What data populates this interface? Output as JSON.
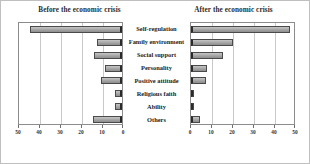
{
  "figure": {
    "left_title": "Before the economic crisis",
    "right_title": "After the economic crisis"
  },
  "chart_data": [
    {
      "type": "bar",
      "orientation": "horizontal",
      "title": "Before the economic crisis",
      "xlabel": "",
      "ylabel": "",
      "xlim": [
        0,
        50
      ],
      "axis_reversed": true,
      "grid": true,
      "legend": "none",
      "tick_labels": [
        "50",
        "40",
        "30",
        "20",
        "10",
        "0"
      ],
      "ticks": [
        50,
        40,
        30,
        20,
        10,
        0
      ],
      "categories": [
        "Self-regulation",
        "Family environment",
        "Social support",
        "Personality",
        "Positive attitude",
        "Religious faith",
        "Ability",
        "Others"
      ],
      "values": [
        44,
        12,
        13.5,
        8,
        10,
        3.5,
        3.5,
        14
      ]
    },
    {
      "type": "bar",
      "orientation": "horizontal",
      "title": "After the economic crisis",
      "xlabel": "",
      "ylabel": "",
      "xlim": [
        0,
        50
      ],
      "axis_reversed": false,
      "grid": true,
      "legend": "none",
      "tick_labels": [
        "0",
        "10",
        "20",
        "30",
        "40",
        "50"
      ],
      "ticks": [
        0,
        10,
        20,
        30,
        40,
        50
      ],
      "categories": [
        "Self-regulation",
        "Family environment",
        "Social support",
        "Personality",
        "Positive attitude",
        "Religious faith",
        "Ability",
        "Others"
      ],
      "values": [
        47,
        20,
        15,
        7.5,
        7,
        1.5,
        1,
        4.5
      ]
    }
  ],
  "colors": {
    "bar_fill": "#ababab",
    "bar_border": "#4a4a4a",
    "grid": "#c9c9c9",
    "axis": "#8c8c8c",
    "text": "#222222"
  }
}
